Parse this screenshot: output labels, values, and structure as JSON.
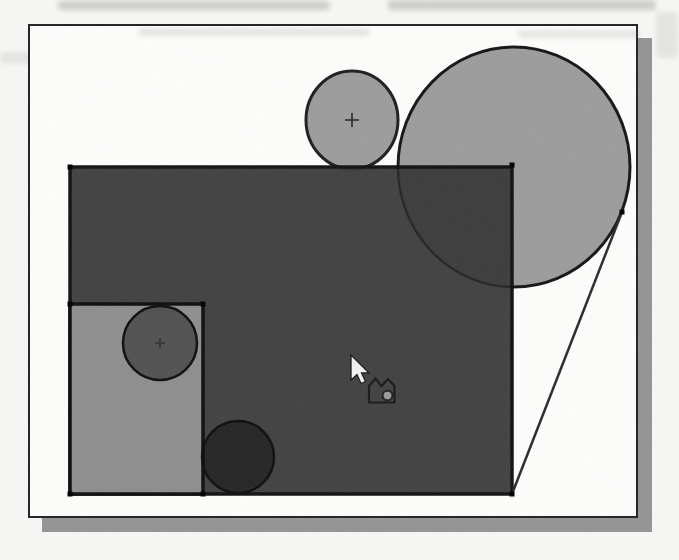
{
  "colors": {
    "page_bg": "#f7f7f5",
    "panel_bg": "#fdfdfc",
    "panel_border": "#232323",
    "drop_shadow": "#949494",
    "main_rect_fill": "#383838",
    "main_rect_stroke": "#131313",
    "inner_rect_fill": "#8e8e8e",
    "inner_rect_stroke": "#0f0f0f",
    "tangent_circle_fill": "#9c9c9c",
    "tangent_circle_stroke": "#1f1f1f",
    "inner_circle_fill": "#000000",
    "inner_circle_stroke": "#0f0f0f",
    "tangent_line_stroke": "#2b2b2b",
    "vertex_dot": "#000000"
  },
  "drawing": {
    "main_rect": {
      "x": 70,
      "y": 167,
      "w": 442,
      "h": 327,
      "fill_opacity": 0.95
    },
    "inner_rect": {
      "x": 70,
      "y": 304,
      "w": 133,
      "h": 190
    },
    "circle_medium": {
      "cx": 352,
      "cy": 120,
      "rx": 46,
      "ry": 49
    },
    "circle_large": {
      "cx": 514,
      "cy": 167,
      "rx": 116,
      "ry": 120
    },
    "circle_inner_top": {
      "cx": 160,
      "cy": 343,
      "r": 37,
      "fill_opacity": 0.42
    },
    "circle_inner_bottom": {
      "cx": 238,
      "cy": 457,
      "r": 36,
      "fill_opacity": 0.42
    },
    "tangent_line": {
      "x1": 622,
      "y1": 212,
      "x2": 512,
      "y2": 494
    },
    "vertex_dots": [
      {
        "x": 67.5,
        "y": 164.5
      },
      {
        "x": 509.5,
        "y": 162.5
      },
      {
        "x": 509.5,
        "y": 491.5
      },
      {
        "x": 67.5,
        "y": 491.5
      },
      {
        "x": 67.5,
        "y": 301.5
      },
      {
        "x": 200.5,
        "y": 301.5
      },
      {
        "x": 200.5,
        "y": 491.5
      },
      {
        "x": 619.5,
        "y": 209.5
      }
    ],
    "center_marks": [
      {
        "d": "M345,120 h14 M352,113 v14"
      },
      {
        "d": "M155,343 h10 M160,338 v10"
      },
      {
        "d": "M233,457 h10 M238,452 v10"
      }
    ],
    "cursor": {
      "arrow_points": "351,355 351,380 357,374.5 361,383.5 365.5,381.5 361.5,373 369,373",
      "icon_path": "M369,402.5 L369,386 L375.5,378.5 L381.5,386 L388,379 L394.5,386 L394.5,402.5 Z",
      "icon_dot": {
        "cx": 387.5,
        "cy": 395.5,
        "r": 4.8
      }
    }
  }
}
